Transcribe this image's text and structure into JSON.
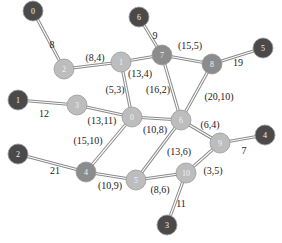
{
  "colors": {
    "external": "#4a4a4a",
    "hub": "#8c8c8c",
    "internal": "#bdbdbd",
    "edge": "#8a8a8a",
    "background": "#ffffff"
  },
  "nodes": [
    {
      "id": "ext0",
      "label": "0",
      "type": "external",
      "x": 33,
      "y": 11
    },
    {
      "id": "ext6",
      "label": "6",
      "type": "external",
      "x": 139,
      "y": 17
    },
    {
      "id": "ext5",
      "label": "5",
      "type": "external",
      "x": 263,
      "y": 48
    },
    {
      "id": "ext1",
      "label": "1",
      "type": "external",
      "x": 18,
      "y": 100
    },
    {
      "id": "ext4",
      "label": "4",
      "type": "external",
      "x": 265,
      "y": 135
    },
    {
      "id": "ext2",
      "label": "2",
      "type": "external",
      "x": 18,
      "y": 154
    },
    {
      "id": "ext3",
      "label": "3",
      "type": "external",
      "x": 167,
      "y": 225
    },
    {
      "id": "in7",
      "label": "7",
      "type": "hub",
      "x": 162,
      "y": 55
    },
    {
      "id": "in8",
      "label": "8",
      "type": "hub",
      "x": 212,
      "y": 64
    },
    {
      "id": "in4",
      "label": "4",
      "type": "hub",
      "x": 86,
      "y": 172
    },
    {
      "id": "in2",
      "label": "2",
      "type": "internal",
      "x": 64,
      "y": 69
    },
    {
      "id": "in1",
      "label": "1",
      "type": "internal",
      "x": 121,
      "y": 62
    },
    {
      "id": "in3",
      "label": "3",
      "type": "internal",
      "x": 77,
      "y": 105
    },
    {
      "id": "in0",
      "label": "0",
      "type": "internal",
      "x": 132,
      "y": 117
    },
    {
      "id": "in6",
      "label": "6",
      "type": "internal",
      "x": 181,
      "y": 120
    },
    {
      "id": "in9",
      "label": "9",
      "type": "internal",
      "x": 220,
      "y": 143
    },
    {
      "id": "in5",
      "label": "5",
      "type": "internal",
      "x": 136,
      "y": 180
    },
    {
      "id": "in10",
      "label": "10",
      "type": "internal",
      "x": 186,
      "y": 173
    }
  ],
  "edges": [
    {
      "from": "ext0",
      "to": "in2",
      "label": "8",
      "lx": 52,
      "ly": 44
    },
    {
      "from": "in2",
      "to": "in1",
      "label": "(8,4)",
      "lx": 95,
      "ly": 57
    },
    {
      "from": "ext6",
      "to": "in7",
      "label": "9",
      "lx": 155,
      "ly": 35
    },
    {
      "from": "in1",
      "to": "in7",
      "label": "(13,4)",
      "lx": 140,
      "ly": 73
    },
    {
      "from": "in7",
      "to": "in8",
      "label": "(15,5)",
      "lx": 190,
      "ly": 45
    },
    {
      "from": "in8",
      "to": "ext5",
      "label": "19",
      "lx": 238,
      "ly": 62
    },
    {
      "from": "in1",
      "to": "in0",
      "label": "(5,3)",
      "lx": 115,
      "ly": 89
    },
    {
      "from": "in7",
      "to": "in6",
      "label": "(16,2)",
      "lx": 158,
      "ly": 89
    },
    {
      "from": "in8",
      "to": "in6",
      "label": "(20,10)",
      "lx": 219,
      "ly": 96
    },
    {
      "from": "ext1",
      "to": "in3",
      "label": "12",
      "lx": 44,
      "ly": 113
    },
    {
      "from": "in3",
      "to": "in0",
      "label": "(13,11)",
      "lx": 102,
      "ly": 120
    },
    {
      "from": "in0",
      "to": "in6",
      "label": "(10,8)",
      "lx": 155,
      "ly": 129
    },
    {
      "from": "in6",
      "to": "in9",
      "label": "(6,4)",
      "lx": 210,
      "ly": 124
    },
    {
      "from": "in9",
      "to": "ext4",
      "label": "7",
      "lx": 244,
      "ly": 150
    },
    {
      "from": "in0",
      "to": "in4",
      "label": "(15,10)",
      "lx": 88,
      "ly": 140
    },
    {
      "from": "in6",
      "to": "in5",
      "label": "(13,6)",
      "lx": 179,
      "ly": 151
    },
    {
      "from": "in9",
      "to": "in10",
      "label": "(3,5)",
      "lx": 213,
      "ly": 170
    },
    {
      "from": "ext2",
      "to": "in4",
      "label": "21",
      "lx": 55,
      "ly": 170
    },
    {
      "from": "in4",
      "to": "in5",
      "label": "(10,9)",
      "lx": 110,
      "ly": 185
    },
    {
      "from": "in5",
      "to": "in10",
      "label": "(8,6)",
      "lx": 160,
      "ly": 189
    },
    {
      "from": "in10",
      "to": "ext3",
      "label": "11",
      "lx": 181,
      "ly": 203
    }
  ]
}
